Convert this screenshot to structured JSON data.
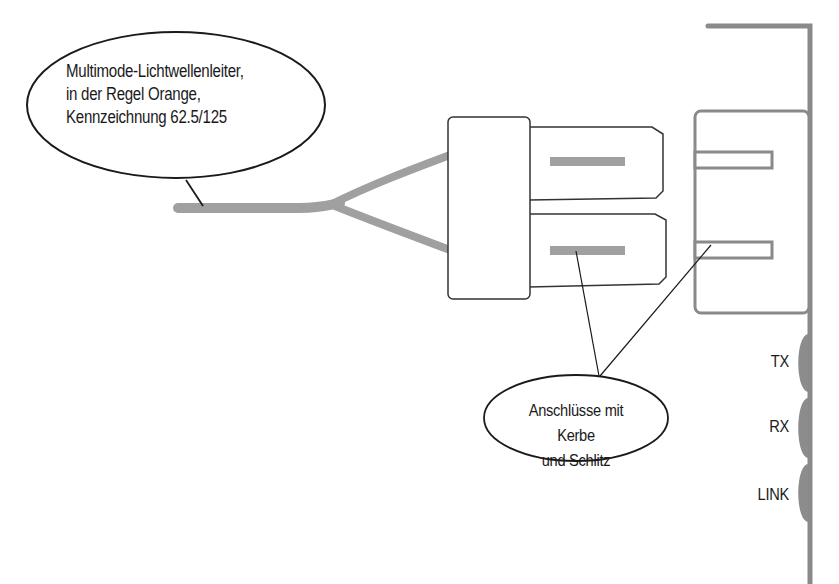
{
  "diagram": {
    "title_hidden": "",
    "callouts": {
      "fiber_cable": {
        "lines": [
          "Multimode-Lichtwellenleiter,",
          "in der Regel Orange,",
          "Kennzeichnung 62.5/125"
        ]
      },
      "connectors": {
        "lines": [
          "Anschlüsse mit Kerbe",
          "und Schlitz"
        ]
      }
    },
    "leds": [
      {
        "label": "TX"
      },
      {
        "label": "RX"
      },
      {
        "label": "LINK"
      }
    ],
    "colors": {
      "outline": "#333333",
      "cable": "#999999",
      "card": "#8a8a8a",
      "led": "#8c8c8c",
      "background": "#ffffff"
    }
  }
}
